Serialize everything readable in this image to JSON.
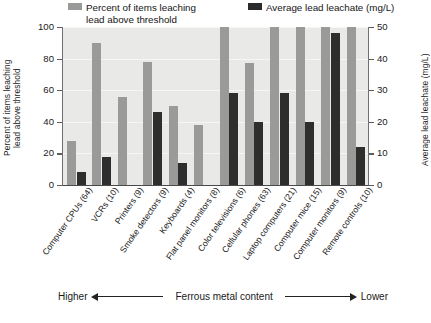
{
  "chart_data": {
    "type": "bar",
    "title": "",
    "subtitle": "",
    "xlabel": "",
    "ylabel": "Percent of items leaching\nlead above threshold",
    "ylabel_right": "Average lead leachate (mg/L)",
    "ylim": [
      0,
      100
    ],
    "ylim_right": [
      0,
      50
    ],
    "yticks": [
      0,
      20,
      40,
      60,
      80,
      100
    ],
    "yticks_right": [
      0,
      10,
      20,
      30,
      40,
      50
    ],
    "grid": true,
    "legend_position": "top",
    "categories": [
      "Computer CPUs (64)",
      "VCRs (10)",
      "Printers (9)",
      "Smoke detectors (9)",
      "Keyboards (4)",
      "Flat panel monitors (8)",
      "Color televisions (6)",
      "Cellular phones (63)",
      "Laptop computers (21)",
      "Computer mice (15)",
      "Computer monitors (9)",
      "Remote controls (10)"
    ],
    "series": [
      {
        "name": "Percent of items leaching lead above threshold",
        "axis": "left",
        "unit": "%",
        "color": "#9a9a98",
        "values": [
          28,
          90,
          56,
          78,
          50,
          38,
          100,
          77,
          100,
          100,
          100,
          100
        ]
      },
      {
        "name": "Average lead leachate (mg/L)",
        "axis": "right",
        "unit": "mg/L",
        "color": "#2e2e2e",
        "values": [
          4,
          9,
          0,
          23,
          7,
          0,
          29,
          20,
          29,
          20,
          48,
          12
        ]
      }
    ],
    "annotation": {
      "left": "Higher",
      "middle": "Ferrous metal content",
      "right": "Lower"
    }
  },
  "legend": {
    "items": [
      {
        "label": "Percent of items leaching lead above threshold",
        "swatch": "pct"
      },
      {
        "label": "Average lead leachate (mg/L)",
        "swatch": "lch"
      }
    ],
    "label_pct_line1": "Percent of items leaching",
    "label_pct_line2": "lead above threshold",
    "label_lch": "Average lead leachate (mg/L)"
  },
  "axes": {
    "left_title": "Percent of items leaching\nlead above threshold",
    "right_title": "Average lead leachate (mg/L)",
    "left_ticks": [
      "100",
      "80",
      "60",
      "40",
      "20",
      "0"
    ],
    "right_ticks": [
      "50",
      "40",
      "30",
      "20",
      "10",
      "0"
    ]
  },
  "annotation": {
    "higher": "Higher",
    "middle": "Ferrous metal content",
    "lower": "Lower"
  }
}
